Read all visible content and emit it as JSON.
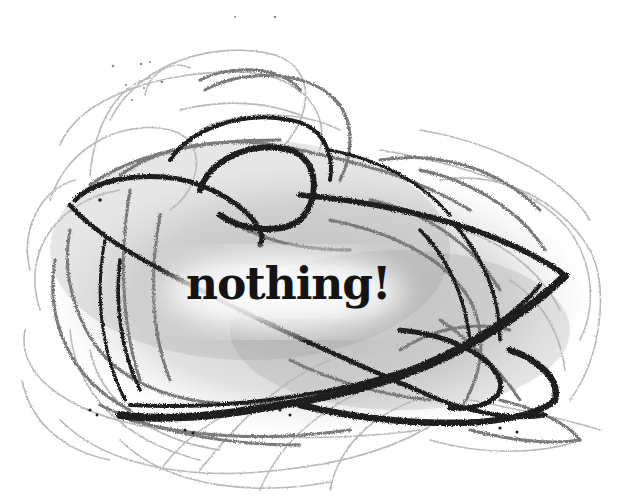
{
  "illustration": {
    "subject": "pencil-scribble",
    "caption": "nothing!",
    "colors": {
      "background": "#ffffff",
      "light_stroke": "#b8b8b8",
      "mid_stroke": "#7a7a7a",
      "dark_stroke": "#1e1e1e",
      "caption_color": "#141414",
      "center_glow": "#ffffff"
    },
    "caption_position": {
      "x": 192,
      "y": 275,
      "width": 170,
      "height": 38
    }
  }
}
